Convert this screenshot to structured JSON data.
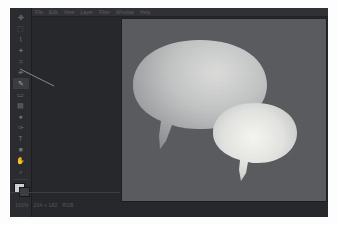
{
  "window": {
    "title": "Untitled",
    "background_color": "#26272a"
  },
  "menu_bar": {
    "items": [
      {
        "label": "File"
      },
      {
        "label": "Edit"
      },
      {
        "label": "View"
      },
      {
        "label": "Layer"
      },
      {
        "label": "Filter"
      },
      {
        "label": "Window"
      },
      {
        "label": "Help"
      }
    ]
  },
  "tool_palette": {
    "background_color": "#2a2b2e",
    "tools": [
      {
        "name": "move-tool",
        "glyph": "✥",
        "active": false
      },
      {
        "name": "marquee-select-tool",
        "glyph": "⬚",
        "active": false
      },
      {
        "name": "lasso-tool",
        "glyph": "⌇",
        "active": false
      },
      {
        "name": "magic-wand-tool",
        "glyph": "✦",
        "active": false
      },
      {
        "name": "crop-tool",
        "glyph": "⌗",
        "active": false
      },
      {
        "name": "eyedropper-tool",
        "glyph": "✒",
        "active": false
      },
      {
        "name": "brush-tool",
        "glyph": "✎",
        "active": true
      },
      {
        "name": "eraser-tool",
        "glyph": "▭",
        "active": false
      },
      {
        "name": "gradient-tool",
        "glyph": "▤",
        "active": false
      },
      {
        "name": "blur-tool",
        "glyph": "●",
        "active": false
      },
      {
        "name": "pen-tool",
        "glyph": "✑",
        "active": false
      },
      {
        "name": "text-tool",
        "glyph": "T",
        "active": false
      },
      {
        "name": "shape-tool",
        "glyph": "■",
        "active": false
      },
      {
        "name": "hand-tool",
        "glyph": "✋",
        "active": false
      },
      {
        "name": "zoom-tool",
        "glyph": "⌕",
        "active": false
      }
    ],
    "foreground_color": "#cfd1d4",
    "background_color_swatch": "#3c3e42"
  },
  "canvas": {
    "background_color": "#5a5b5e",
    "width_px": 204,
    "height_px": 182,
    "zoom_level": "100%"
  },
  "artwork": {
    "title": "Speech Bubbles",
    "shapes": [
      {
        "name": "speech-bubble-large",
        "fill_light": "#d7d8d4",
        "fill_dark": "#8d9093",
        "tail_direction": "down-left"
      },
      {
        "name": "speech-bubble-small",
        "fill_light": "#f2f2ee",
        "fill_dark": "#b9bcbd",
        "tail_direction": "down"
      }
    ]
  },
  "status_bar": {
    "zoom": "100%",
    "doc_size": "204 x 182",
    "color_mode": "RGB"
  }
}
